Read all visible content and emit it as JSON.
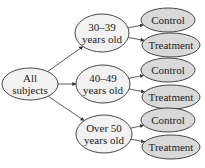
{
  "diagram": {
    "type": "tree",
    "colors": {
      "primary_fill": "#f2f2f2",
      "leaf_fill": "#d9d9d9",
      "stroke": "#333333",
      "text": "#222222"
    },
    "root": {
      "id": "all",
      "lines": [
        "All",
        "subjects"
      ],
      "cx": 30,
      "cy": 84,
      "rx": 28,
      "ry": 16
    },
    "groups": [
      {
        "id": "g1",
        "lines": [
          "30–39",
          "years old"
        ],
        "cx": 102,
        "cy": 33,
        "rx": 27,
        "ry": 19,
        "children": [
          {
            "id": "g1c",
            "label": "Control",
            "cx": 168,
            "cy": 20,
            "rx": 27,
            "ry": 12
          },
          {
            "id": "g1t",
            "label": "Treatment",
            "cx": 171,
            "cy": 45,
            "rx": 29,
            "ry": 12
          }
        ]
      },
      {
        "id": "g2",
        "lines": [
          "40–49",
          "years old"
        ],
        "cx": 103,
        "cy": 84,
        "rx": 27,
        "ry": 19,
        "children": [
          {
            "id": "g2c",
            "label": "Control",
            "cx": 168,
            "cy": 70,
            "rx": 27,
            "ry": 12
          },
          {
            "id": "g2t",
            "label": "Treatment",
            "cx": 171,
            "cy": 97,
            "rx": 29,
            "ry": 12
          }
        ]
      },
      {
        "id": "g3",
        "lines": [
          "Over 50",
          "years old"
        ],
        "cx": 104,
        "cy": 134,
        "rx": 28,
        "ry": 19,
        "children": [
          {
            "id": "g3c",
            "label": "Control",
            "cx": 168,
            "cy": 120,
            "rx": 27,
            "ry": 12
          },
          {
            "id": "g3t",
            "label": "Treatment",
            "cx": 171,
            "cy": 147,
            "rx": 29,
            "ry": 12
          }
        ]
      }
    ]
  }
}
